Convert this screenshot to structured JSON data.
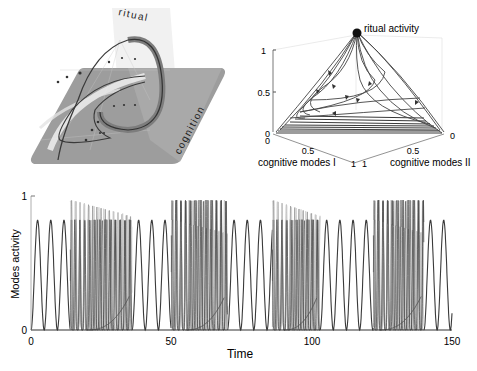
{
  "figure": {
    "panel_a": {
      "type": "3d-schematic",
      "labels": {
        "vertical_plane": "ritual",
        "horizontal_plane": "cognition"
      },
      "colors": {
        "plane": "#9a9a9a",
        "vertical_plane": "#e6e6e6",
        "orbit": "#555555",
        "orbit_halo": "#8a8a8a",
        "inner_band": "#f2f2f2"
      }
    },
    "panel_b": {
      "type": "simplex-3d",
      "apex_label": "ritual activity",
      "z_ticks": [
        "0",
        "0.5",
        "1"
      ],
      "axis_left": {
        "label": "cognitive modes I",
        "ticks": [
          "0",
          "0.5",
          "1"
        ]
      },
      "axis_right": {
        "label": "cognitive modes II",
        "ticks": [
          "0",
          "0.5",
          "1"
        ]
      }
    },
    "panel_c": {
      "ylabel": "Modes activity",
      "xlabel": "Time",
      "y_ticks": [
        "0",
        "1"
      ],
      "x_ticks": [
        "0",
        "50",
        "100",
        "150"
      ]
    }
  },
  "chart_data": [
    {
      "type": "line",
      "title": "",
      "description": "3D simplex trajectories: heteroclinic orbits leaving the ritual-activity vertex (top) toward the cognitive-modes base plane and returning",
      "xlabel": "cognitive modes I",
      "ylabel": "cognitive modes II",
      "zlabel": "ritual activity",
      "xlim": [
        0,
        1
      ],
      "ylim": [
        0,
        1
      ],
      "zlim": [
        0,
        1
      ],
      "ticks": {
        "x": [
          0,
          0.5,
          1
        ],
        "y": [
          0,
          0.5,
          1
        ],
        "z": [
          0,
          0.5,
          1
        ]
      },
      "apex": {
        "label": "ritual activity",
        "value": [
          0,
          0,
          1
        ]
      },
      "grid": false
    },
    {
      "type": "line",
      "title": "",
      "xlabel": "Time",
      "ylabel": "Modes activity",
      "xlim": [
        0,
        150
      ],
      "ylim": [
        0,
        1
      ],
      "x_ticks": [
        0,
        50,
        100,
        150
      ],
      "y_ticks": [
        0,
        1
      ],
      "grid": false,
      "legend": null,
      "series": [
        {
          "name": "ritual modes (slow regular oscillations, peak ≈0.82)",
          "segments": [
            [
              0,
              14
            ],
            [
              36,
              50
            ],
            [
              70,
              86
            ],
            [
              103,
              122
            ],
            [
              140,
              150
            ]
          ],
          "peak": 0.82,
          "period": 4.7
        },
        {
          "name": "cognitive modes (fast switching bursts, peak ≈0.97)",
          "segments": [
            [
              14,
              36
            ],
            [
              50,
              70
            ],
            [
              86,
              103
            ],
            [
              122,
              140
            ]
          ],
          "peak": 0.97,
          "period": 1.4
        },
        {
          "name": "slow ramp during bursts",
          "segments": [
            [
              20,
              35
            ],
            [
              55,
              69
            ],
            [
              90,
              102
            ],
            [
              124,
              139
            ]
          ],
          "end_value": 0.25
        }
      ]
    }
  ]
}
